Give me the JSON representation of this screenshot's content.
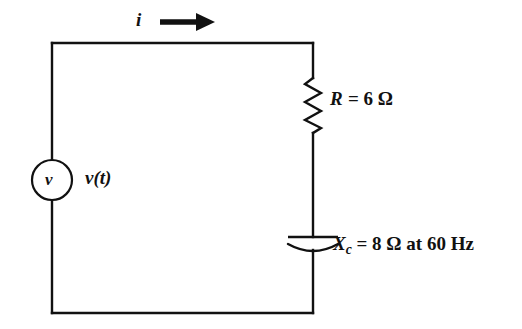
{
  "figure": {
    "type": "circuit-diagram",
    "background_color": "#ffffff",
    "line_color": "#111111"
  },
  "labels": {
    "current": "i",
    "source_symbol": "v",
    "source_label": "v(t)",
    "resistor": {
      "symbol": "R",
      "equals": "=",
      "value": "6",
      "unit": "Ω",
      "full": "R = 6 Ω"
    },
    "capacitor": {
      "symbol": "X",
      "subscript": "c",
      "equals": "=",
      "value": "8",
      "unit": "Ω",
      "condition": "at 60 Hz",
      "full": "X_c = 8 Ω at 60 Hz"
    }
  },
  "components": [
    {
      "name": "voltage-source",
      "kind": "ac-source-circle",
      "label": "v(t)"
    },
    {
      "name": "resistor",
      "kind": "zigzag",
      "label": "R = 6 Ω"
    },
    {
      "name": "capacitor",
      "kind": "curved-plate",
      "label": "X_c = 8 Ω at 60 Hz"
    },
    {
      "name": "current-arrow",
      "kind": "arrow-right",
      "label": "i"
    }
  ]
}
